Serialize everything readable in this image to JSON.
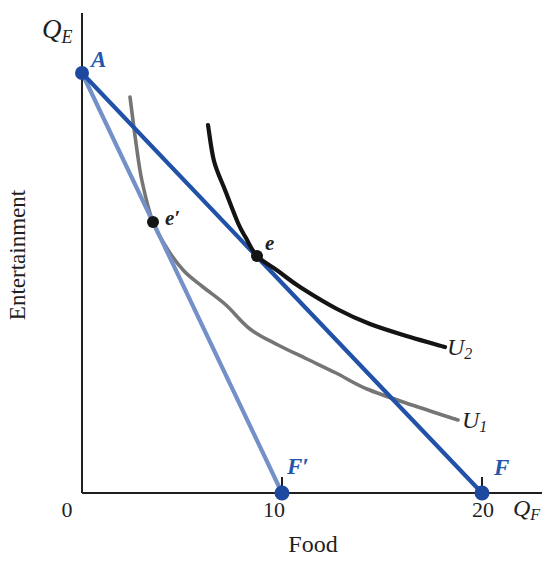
{
  "figure": {
    "width": 558,
    "height": 566,
    "background": "#ffffff"
  },
  "mapping": {
    "origin_px": [
      82,
      493
    ],
    "px_per_unit": 20
  },
  "colors": {
    "axis": "#1f1f1f",
    "budget_line_dark_blue": "#2152a8",
    "budget_line_light_blue": "#7490c9",
    "indifference_u1_gray": "#757575",
    "indifference_u2_black": "#141414",
    "point_blue": "#1d4a9e",
    "point_black": "#141414",
    "label_blue": "#2456ac",
    "label_black": "#1f1f1f"
  },
  "chart_data": {
    "type": "line",
    "title": "",
    "xlabel": "Food",
    "ylabel": "Entertainment",
    "x_axis_symbol": "Q_F",
    "y_axis_symbol": "Q_E",
    "xlim": [
      0,
      23
    ],
    "ylim": [
      0,
      24
    ],
    "x_ticks": [
      0,
      10,
      20
    ],
    "y_ticks": [],
    "grid": false,
    "tick_marks": {
      "x": [
        10,
        20
      ],
      "length_px": 16
    },
    "series": [
      {
        "id": "indifference-curve-U1",
        "label": "U1",
        "kind": "smooth",
        "color_key": "indifference_u1_gray",
        "width": 3.6,
        "points": [
          [
            2.4,
            19.8
          ],
          [
            2.7,
            17.5
          ],
          [
            3.0,
            15.6
          ],
          [
            3.55,
            13.55
          ],
          [
            4.3,
            12.15
          ],
          [
            5.1,
            11.1
          ],
          [
            6.05,
            10.3
          ],
          [
            7.2,
            9.4
          ],
          [
            8.4,
            8.2
          ],
          [
            9.8,
            7.4
          ],
          [
            11.25,
            6.7
          ],
          [
            12.7,
            6.0
          ],
          [
            14.25,
            5.2
          ],
          [
            16.5,
            4.4
          ],
          [
            18.8,
            3.65
          ]
        ]
      },
      {
        "id": "budget-line-AF-prime",
        "label": "Budget line A to F′",
        "kind": "straight",
        "color_key": "budget_line_light_blue",
        "width": 4.2,
        "points": [
          [
            0,
            21
          ],
          [
            10,
            0
          ]
        ]
      },
      {
        "id": "budget-line-AF",
        "label": "Budget line A to F",
        "kind": "straight",
        "color_key": "budget_line_dark_blue",
        "width": 4.2,
        "points": [
          [
            0,
            21
          ],
          [
            20,
            0
          ]
        ]
      },
      {
        "id": "indifference-curve-U2",
        "label": "U2",
        "kind": "smooth",
        "color_key": "indifference_u2_black",
        "width": 4.2,
        "points": [
          [
            6.3,
            18.4
          ],
          [
            6.6,
            16.6
          ],
          [
            7.15,
            15.15
          ],
          [
            7.8,
            13.5
          ],
          [
            8.2,
            12.75
          ],
          [
            8.75,
            11.85
          ],
          [
            9.8,
            11.1
          ],
          [
            10.9,
            10.3
          ],
          [
            12.75,
            9.2
          ],
          [
            14.4,
            8.45
          ],
          [
            16.4,
            7.8
          ],
          [
            18.15,
            7.3
          ]
        ]
      }
    ],
    "markers": [
      {
        "id": "point-A",
        "label": "A",
        "x": 0,
        "y": 21,
        "r": 7,
        "color_key": "point_blue"
      },
      {
        "id": "point-e-prime",
        "label": "e′",
        "x": 3.55,
        "y": 13.55,
        "r": 6,
        "color_key": "point_black"
      },
      {
        "id": "point-e",
        "label": "e",
        "x": 8.75,
        "y": 11.85,
        "r": 6,
        "color_key": "point_black"
      },
      {
        "id": "point-F-prime",
        "label": "F′",
        "x": 10,
        "y": 0,
        "r": 7.5,
        "color_key": "point_blue"
      },
      {
        "id": "point-F",
        "label": "F",
        "x": 20,
        "y": 0,
        "r": 7.5,
        "color_key": "point_blue"
      }
    ]
  },
  "annotations": [
    {
      "name": "y-axis-symbol",
      "text": "Q",
      "sub": "E",
      "x": 42,
      "y": 38,
      "size": 27,
      "color_key": "label_black",
      "italic": true,
      "bold": false,
      "anchor": "start"
    },
    {
      "name": "point-label-A",
      "text": "A",
      "x": 91,
      "y": 67,
      "size": 23,
      "color_key": "label_blue",
      "italic": true,
      "bold": true,
      "anchor": "start"
    },
    {
      "name": "point-label-e-prime",
      "text": "e′",
      "x": 165,
      "y": 225,
      "size": 21,
      "color_key": "label_black",
      "italic": true,
      "bold": true,
      "anchor": "start"
    },
    {
      "name": "point-label-e",
      "text": "e",
      "x": 265,
      "y": 250,
      "size": 21,
      "color_key": "label_black",
      "italic": true,
      "bold": true,
      "anchor": "start"
    },
    {
      "name": "curve-label-U2",
      "text": "U",
      "sub": "2",
      "x": 447,
      "y": 355,
      "size": 24,
      "color_key": "label_black",
      "italic": true,
      "bold": false,
      "anchor": "start"
    },
    {
      "name": "curve-label-U1",
      "text": "U",
      "sub": "1",
      "x": 462,
      "y": 428,
      "size": 24,
      "color_key": "label_black",
      "italic": true,
      "bold": false,
      "anchor": "start"
    },
    {
      "name": "point-label-F-prime",
      "text": "F′",
      "x": 287,
      "y": 474,
      "size": 23,
      "color_key": "label_blue",
      "italic": true,
      "bold": true,
      "anchor": "start"
    },
    {
      "name": "point-label-F",
      "text": "F",
      "x": 494,
      "y": 475,
      "size": 23,
      "color_key": "label_blue",
      "italic": true,
      "bold": true,
      "anchor": "start"
    },
    {
      "name": "tick-label-0",
      "text": "0",
      "x": 67,
      "y": 517,
      "size": 22,
      "color_key": "label_black",
      "italic": false,
      "bold": false,
      "anchor": "middle"
    },
    {
      "name": "tick-label-10",
      "text": "10",
      "x": 274,
      "y": 517,
      "size": 22,
      "color_key": "label_black",
      "italic": false,
      "bold": false,
      "anchor": "middle"
    },
    {
      "name": "tick-label-20",
      "text": "20",
      "x": 483,
      "y": 517,
      "size": 22,
      "color_key": "label_black",
      "italic": false,
      "bold": false,
      "anchor": "middle"
    },
    {
      "name": "x-axis-symbol",
      "text": "Q",
      "sub": "F",
      "x": 513,
      "y": 516,
      "size": 24,
      "color_key": "label_black",
      "italic": true,
      "bold": false,
      "anchor": "start"
    },
    {
      "name": "x-axis-title",
      "text": "Food",
      "x": 313,
      "y": 552,
      "size": 24,
      "color_key": "label_black",
      "italic": false,
      "bold": false,
      "anchor": "middle"
    },
    {
      "name": "y-axis-title",
      "text": "Entertainment",
      "x": 25,
      "y": 255,
      "size": 23,
      "color_key": "label_black",
      "italic": false,
      "bold": false,
      "anchor": "middle",
      "rotate": -90
    }
  ]
}
